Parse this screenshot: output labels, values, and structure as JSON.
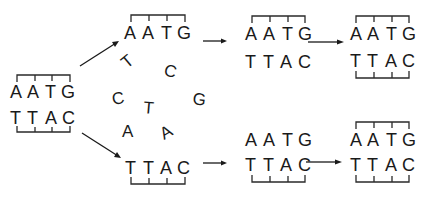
{
  "diagram": {
    "title": "",
    "parent": {
      "top_strand": [
        "A",
        "A",
        "T",
        "G"
      ],
      "bottom_strand": [
        "T",
        "T",
        "A",
        "C"
      ]
    },
    "separated": {
      "upper_strand": [
        "A",
        "A",
        "T",
        "G"
      ],
      "lower_strand": [
        "T",
        "T",
        "A",
        "C"
      ]
    },
    "free_nucleotides": [
      "T",
      "C",
      "G",
      "C",
      "T",
      "A",
      "A"
    ],
    "upper_branch": {
      "intermediate": {
        "top_strand": [
          "A",
          "A",
          "T",
          "G"
        ],
        "bottom_strand": [
          "T",
          "T",
          "A",
          "C"
        ]
      },
      "final": {
        "top_strand": [
          "A",
          "A",
          "T",
          "G"
        ],
        "bottom_strand": [
          "T",
          "T",
          "A",
          "C"
        ]
      }
    },
    "lower_branch": {
      "intermediate": {
        "top_strand": [
          "A",
          "A",
          "T",
          "G"
        ],
        "bottom_strand": [
          "T",
          "T",
          "A",
          "C"
        ]
      },
      "final": {
        "top_strand": [
          "A",
          "A",
          "T",
          "G"
        ],
        "bottom_strand": [
          "T",
          "T",
          "A",
          "C"
        ]
      }
    }
  }
}
